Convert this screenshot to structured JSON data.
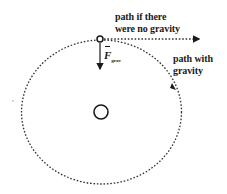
{
  "diagram": {
    "labels": {
      "no_gravity_line1": "path if there",
      "no_gravity_line2": "were no gravity",
      "with_gravity_line1": "path with",
      "with_gravity_line2": "gravity",
      "force_symbol": "F",
      "force_subscript": "grav"
    },
    "elements": {
      "central_body": {
        "cx": 101,
        "cy": 112,
        "r": 7
      },
      "orbit": {
        "cx": 101.5,
        "cy": 112,
        "rx": 80,
        "ry": 72,
        "style": "dotted"
      },
      "orbiting_body": {
        "cx": 100,
        "cy": 39,
        "r": 3
      },
      "straight_path": {
        "x1": 103,
        "y1": 39,
        "x2": 200,
        "y2": 39,
        "style": "dotted",
        "arrow": true
      },
      "force_arrow": {
        "x": 100,
        "y1": 43,
        "y2": 71,
        "direction": "down"
      }
    },
    "colors": {
      "ink": "#1a1a1a",
      "background": "#ffffff"
    }
  }
}
